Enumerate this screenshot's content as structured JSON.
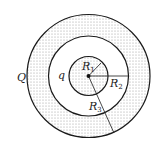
{
  "diagram": {
    "type": "concentric-spheres-cross-section",
    "center": {
      "x": 88.5,
      "y": 76
    },
    "circles": [
      {
        "name": "inner-sphere",
        "radius_px": 19.5,
        "filled": true,
        "label": "R",
        "label_sub": "1"
      },
      {
        "name": "middle-circle",
        "radius_px": 40,
        "filled": false,
        "label": "R",
        "label_sub": "2"
      },
      {
        "name": "outer-circle",
        "radius_px": 61.5,
        "filled": true,
        "label": "R",
        "label_sub": "3"
      }
    ],
    "labels": {
      "outer_charge": "Q",
      "inner_charge": "q",
      "r1": {
        "main": "R",
        "sub": "1"
      },
      "r2": {
        "main": "R",
        "sub": "2"
      },
      "r3": {
        "main": "R",
        "sub": "3"
      }
    },
    "colors": {
      "stroke": "#1a1a1a",
      "dot_fill": "#9a9a9a",
      "background": "#ffffff"
    }
  }
}
